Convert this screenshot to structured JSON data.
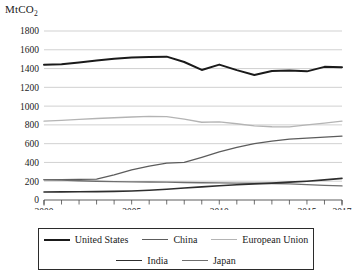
{
  "chart_data": {
    "type": "line",
    "title": "",
    "unit_label": "MtCO",
    "unit_label_sub": "2",
    "xlabel": "",
    "ylabel": "MtCO2",
    "xlim": [
      2000,
      2017
    ],
    "ylim": [
      0,
      1800
    ],
    "ytick_step": 200,
    "grid": true,
    "legend_position": "bottom",
    "x": [
      2000,
      2001,
      2002,
      2003,
      2004,
      2005,
      2006,
      2007,
      2008,
      2009,
      2010,
      2011,
      2012,
      2013,
      2014,
      2015,
      2016,
      2017
    ],
    "xtick_labels": [
      "2000",
      "2005",
      "2010",
      "2015",
      "2017"
    ],
    "xtick_values": [
      2000,
      2005,
      2010,
      2015,
      2017
    ],
    "ytick_labels": [
      "0",
      "200",
      "400",
      "600",
      "800",
      "1000",
      "1200",
      "1400",
      "1600",
      "1800"
    ],
    "ytick_values": [
      0,
      200,
      400,
      600,
      800,
      1000,
      1200,
      1400,
      1600,
      1800
    ],
    "series": [
      {
        "name": "United States",
        "color": "#1a1a1a",
        "width": 2.0,
        "values": [
          1440,
          1447,
          1465,
          1485,
          1505,
          1518,
          1522,
          1527,
          1470,
          1385,
          1442,
          1383,
          1332,
          1375,
          1378,
          1370,
          1418,
          1415
        ]
      },
      {
        "name": "China",
        "color": "#5c5c5c",
        "width": 1.3,
        "values": [
          218,
          218,
          219,
          222,
          268,
          320,
          360,
          392,
          400,
          455,
          512,
          560,
          600,
          628,
          648,
          660,
          670,
          680
        ]
      },
      {
        "name": "European Union",
        "color": "#b4b4b4",
        "width": 1.3,
        "values": [
          840,
          848,
          858,
          868,
          876,
          884,
          890,
          888,
          862,
          828,
          832,
          812,
          790,
          780,
          778,
          800,
          818,
          840
        ]
      },
      {
        "name": "India",
        "color": "#2e2e2e",
        "width": 1.6,
        "values": [
          86,
          87,
          88,
          89,
          92,
          96,
          104,
          115,
          128,
          140,
          152,
          163,
          172,
          180,
          190,
          200,
          214,
          230
        ]
      },
      {
        "name": "Japan",
        "color": "#6e6e6e",
        "width": 1.4,
        "values": [
          215,
          212,
          205,
          200,
          196,
          193,
          192,
          190,
          187,
          184,
          182,
          180,
          178,
          176,
          172,
          164,
          156,
          150
        ]
      }
    ]
  },
  "legend": {
    "row1": [
      {
        "label": "United States",
        "color": "#1a1a1a",
        "width": 2.0
      },
      {
        "label": "China",
        "color": "#5c5c5c",
        "width": 1.4
      },
      {
        "label": "European Union",
        "color": "#b4b4b4",
        "width": 1.4
      }
    ],
    "row2": [
      {
        "label": "India",
        "color": "#2e2e2e",
        "width": 1.8
      },
      {
        "label": "Japan",
        "color": "#6e6e6e",
        "width": 1.5
      }
    ]
  }
}
